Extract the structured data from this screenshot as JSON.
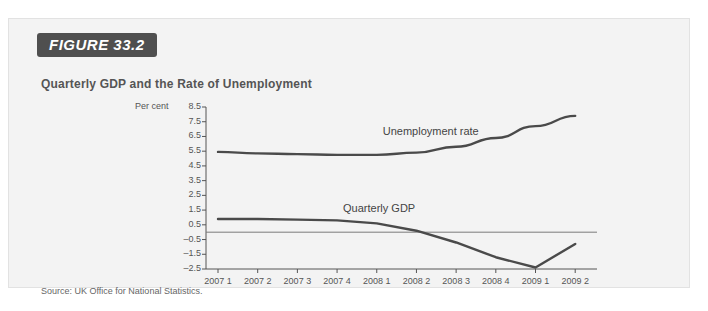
{
  "figure": {
    "badge": "FIGURE 33.2",
    "title": "Quarterly GDP and the Rate of Unemployment",
    "source": "Source: UK Office for National Statistics."
  },
  "chart_data": {
    "type": "line",
    "title": "Quarterly GDP and the Rate of Unemployment",
    "xlabel": "",
    "ylabel": "Per cent",
    "ylim": [
      -2.5,
      8.5
    ],
    "ytick_labels": [
      "8.5",
      "7.5",
      "6.5",
      "5.5",
      "4.5",
      "3.5",
      "2.5",
      "1.5",
      "0.5",
      "–0.5",
      "–1.5",
      "–2.5"
    ],
    "ytick_values": [
      8.5,
      7.5,
      6.5,
      5.5,
      4.5,
      3.5,
      2.5,
      1.5,
      0.5,
      -0.5,
      -1.5,
      -2.5
    ],
    "grid": false,
    "zero_line": true,
    "legend_position": "inline-labels",
    "categories": [
      "2007 1",
      "2007 2",
      "2007 3",
      "2007 4",
      "2008 1",
      "2008 2",
      "2008 3",
      "2008 4",
      "2009 1",
      "2009 2"
    ],
    "series": [
      {
        "name": "Unemployment rate",
        "color": "#4a4a4a",
        "values": [
          5.45,
          5.35,
          5.3,
          5.25,
          5.25,
          5.4,
          5.8,
          6.4,
          7.2,
          7.9
        ],
        "label_x": "2008 1",
        "label_y": 6.8
      },
      {
        "name": "Quarterly GDP",
        "color": "#4a4a4a",
        "values": [
          0.9,
          0.9,
          0.85,
          0.8,
          0.6,
          0.1,
          -0.7,
          -1.7,
          -2.4,
          -0.8
        ],
        "label_x": "2007 4",
        "label_y": 1.6
      }
    ]
  }
}
